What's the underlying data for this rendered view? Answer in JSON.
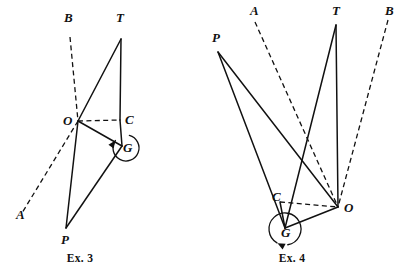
{
  "plate": {
    "background_color": "#ffffff",
    "ink_color": "#111111",
    "width": 410,
    "height": 274
  },
  "figures": [
    {
      "id": "ex3",
      "caption": "Ex. 3",
      "caption_pos": {
        "x": 80,
        "y": 262
      },
      "points": {
        "A": {
          "x": 22,
          "y": 213,
          "label": "A",
          "label_x": 16,
          "label_y": 219
        },
        "B": {
          "x": 70,
          "y": 37,
          "label": "B",
          "label_x": 64,
          "label_y": 22
        },
        "T": {
          "x": 121,
          "y": 39,
          "label": "T",
          "label_x": 116,
          "label_y": 22
        },
        "O": {
          "x": 78,
          "y": 121,
          "label": "O",
          "label_x": 63,
          "label_y": 125
        },
        "C": {
          "x": 120,
          "y": 120,
          "label": "C",
          "label_x": 125,
          "label_y": 124
        },
        "G": {
          "x": 122,
          "y": 146,
          "label": "G",
          "label_x": 123,
          "label_y": 152
        },
        "P": {
          "x": 66,
          "y": 228,
          "label": "P",
          "label_x": 61,
          "label_y": 244
        }
      },
      "solid_segments": [
        {
          "name": "segment-O-T",
          "from": "O",
          "to": "T"
        },
        {
          "name": "segment-T-C",
          "from": "T",
          "to": "C"
        },
        {
          "name": "segment-C-G",
          "from": "C",
          "to": "G"
        },
        {
          "name": "segment-O-G",
          "from": "O",
          "to": "G"
        },
        {
          "name": "segment-O-P",
          "from": "O",
          "to": "P"
        },
        {
          "name": "segment-G-P",
          "from": "G",
          "to": "P"
        }
      ],
      "dashed_segments": [
        {
          "name": "dashed-ray-B-through-O",
          "from": "B",
          "to": "O"
        },
        {
          "name": "dashed-ray-O-to-A",
          "from": "O",
          "to": "A"
        },
        {
          "name": "dashed-segment-O-C",
          "from": "O",
          "to": "C"
        }
      ],
      "rotation_arc": {
        "name": "rotation-arc-G",
        "center_x": 126,
        "center_y": 148,
        "radius": 13,
        "start_deg": -75,
        "sweep_deg": 290,
        "arrow_deg": 215
      }
    },
    {
      "id": "ex4",
      "caption": "Ex. 4",
      "caption_pos": {
        "x": 292,
        "y": 262
      },
      "points": {
        "P": {
          "x": 218,
          "y": 52,
          "label": "P",
          "label_x": 212,
          "label_y": 42
        },
        "A": {
          "x": 255,
          "y": 22,
          "label": "A",
          "label_x": 250,
          "label_y": 15
        },
        "T": {
          "x": 336,
          "y": 25,
          "label": "T",
          "label_x": 332,
          "label_y": 15
        },
        "B": {
          "x": 388,
          "y": 20,
          "label": "B",
          "label_x": 385,
          "label_y": 15
        },
        "C": {
          "x": 280,
          "y": 202,
          "label": "C",
          "label_x": 272,
          "label_y": 201
        },
        "G": {
          "x": 285,
          "y": 228,
          "label": "G",
          "label_x": 281,
          "label_y": 237
        },
        "O": {
          "x": 338,
          "y": 207,
          "label": "O",
          "label_x": 344,
          "label_y": 212
        }
      },
      "solid_segments": [
        {
          "name": "segment-P-G",
          "from": "P",
          "to": "G"
        },
        {
          "name": "segment-P-O",
          "from": "P",
          "to": "O"
        },
        {
          "name": "segment-T-G",
          "from": "T",
          "to": "G"
        },
        {
          "name": "segment-T-O",
          "from": "T",
          "to": "O"
        },
        {
          "name": "segment-G-O",
          "from": "G",
          "to": "O"
        },
        {
          "name": "segment-C-G",
          "from": "C",
          "to": "G"
        }
      ],
      "dashed_segments": [
        {
          "name": "dashed-ray-A-to-O",
          "from": "A",
          "to": "O"
        },
        {
          "name": "dashed-ray-B-to-O",
          "from": "B",
          "to": "O"
        },
        {
          "name": "dashed-segment-C-O",
          "from": "C",
          "to": "O"
        }
      ],
      "rotation_arc": {
        "name": "rotation-arc-G",
        "center_x": 285,
        "center_y": 229,
        "radius": 16,
        "start_deg": 120,
        "sweep_deg": 320,
        "arrow_deg": 118
      }
    }
  ]
}
